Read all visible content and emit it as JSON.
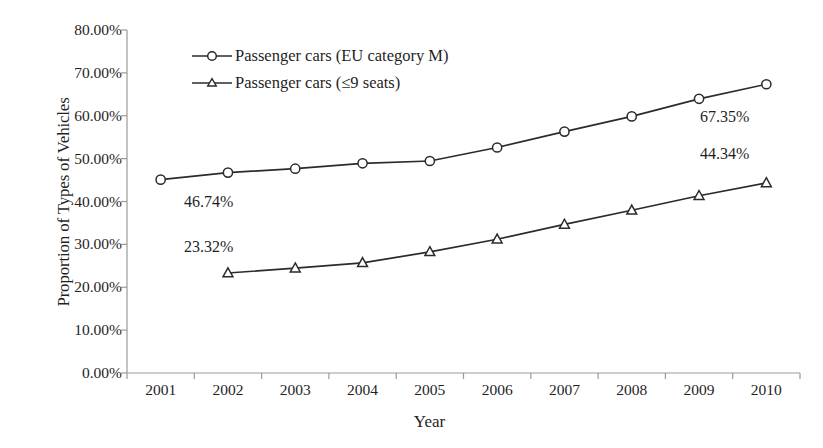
{
  "chart_data": {
    "type": "line",
    "title": "",
    "xlabel": "Year",
    "ylabel": "Proportion of Types of  Vehicles",
    "x": [
      2001,
      2002,
      2003,
      2004,
      2005,
      2006,
      2007,
      2008,
      2009,
      2010
    ],
    "categories": [
      "2001",
      "2002",
      "2003",
      "2004",
      "2005",
      "2006",
      "2007",
      "2008",
      "2009",
      "2010"
    ],
    "series": [
      {
        "name": "Passenger cars (EU category M)",
        "marker": "circle",
        "values": [
          45.1,
          46.74,
          47.65,
          48.9,
          49.45,
          52.6,
          56.3,
          59.85,
          63.95,
          67.35
        ]
      },
      {
        "name": "Passenger cars (≤9 seats)",
        "marker": "triangle",
        "values": [
          null,
          23.32,
          24.45,
          25.7,
          28.25,
          31.2,
          34.65,
          37.95,
          41.35,
          44.34
        ]
      }
    ],
    "ylim": [
      0,
      80
    ],
    "ytick_step": 10,
    "ytick_labels": [
      "80.00%",
      "70.00%",
      "60.00%",
      "50.00%",
      "40.00%",
      "30.00%",
      "20.00%",
      "10.00%",
      "0.00%"
    ],
    "ytick_values": [
      80,
      70,
      60,
      50,
      40,
      30,
      20,
      10,
      0
    ],
    "grid": false,
    "legend_position": "top-left-inside",
    "annotations": [
      {
        "text": "46.74%",
        "series": "Passenger cars (EU category M)",
        "x": 2002,
        "value": 46.74
      },
      {
        "text": "23.32%",
        "series": "Passenger cars (≤9 seats)",
        "x": 2002,
        "value": 23.32
      },
      {
        "text": "67.35%",
        "series": "Passenger cars (EU category M)",
        "x": 2010,
        "value": 67.35
      },
      {
        "text": "44.34%",
        "series": "Passenger cars (≤9 seats)",
        "x": 2010,
        "value": 44.34
      }
    ],
    "colors": {
      "line": "#2b2b2b",
      "marker_fill": "#ffffff",
      "marker_stroke": "#2b2b2b",
      "axis": "#9a9a9a",
      "text": "#1f1f1f",
      "background": "#ffffff"
    }
  },
  "labels": {
    "y_axis_title": "Proportion of Types of  Vehicles",
    "x_axis_title": "Year",
    "y_ticks": [
      "80.00%",
      "70.00%",
      "60.00%",
      "50.00%",
      "40.00%",
      "30.00%",
      "20.00%",
      "10.00%",
      "0.00%"
    ],
    "x_ticks": [
      "2001",
      "2002",
      "2003",
      "2004",
      "2005",
      "2006",
      "2007",
      "2008",
      "2009",
      "2010"
    ],
    "legend": [
      "Passenger cars (EU category M)",
      "Passenger cars (≤9 seats)"
    ],
    "annotations": [
      "46.74%",
      "23.32%",
      "67.35%",
      "44.34%"
    ]
  }
}
